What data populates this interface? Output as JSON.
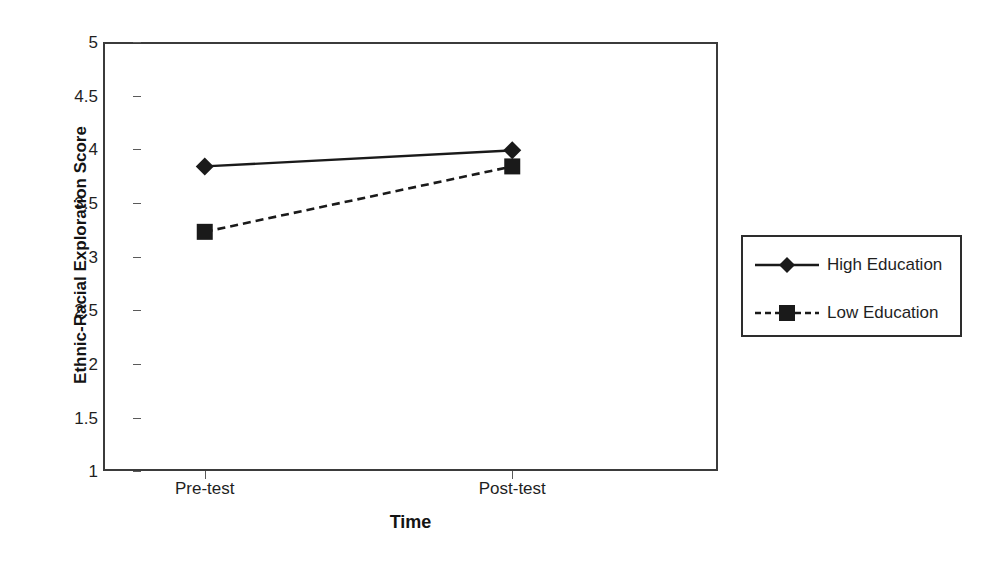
{
  "chart_data": {
    "type": "line",
    "title": "",
    "xlabel": "Time",
    "ylabel": "Ethnic-Racial Exploration Score",
    "categories": [
      "Pre-test",
      "Post-test"
    ],
    "ylim": [
      1,
      5
    ],
    "yticks": [
      "1",
      "1.5",
      "2",
      "2.5",
      "3",
      "3.5",
      "4",
      "4.5",
      "5"
    ],
    "ytick_values": [
      1,
      1.5,
      2,
      2.5,
      3,
      3.5,
      4,
      4.5,
      5
    ],
    "grid": false,
    "legend_position": "right-outside",
    "series": [
      {
        "name": "High Education",
        "values": [
          3.84,
          3.99
        ],
        "line_style": "solid",
        "marker": "diamond",
        "color": "#1a1a1a"
      },
      {
        "name": "Low Education",
        "values": [
          3.23,
          3.84
        ],
        "line_style": "dashed",
        "marker": "square",
        "color": "#1a1a1a"
      }
    ]
  },
  "legend": {
    "entries": [
      {
        "label": "High Education",
        "marker": "diamond-marker",
        "line": "solid-line-sample"
      },
      {
        "label": "Low Education",
        "marker": "square-marker",
        "line": "dashed-line-sample"
      }
    ]
  },
  "colors": {
    "line": "#1a1a1a",
    "frame": "#3b3b3b",
    "text": "#1f1f1f",
    "background": "#ffffff"
  }
}
